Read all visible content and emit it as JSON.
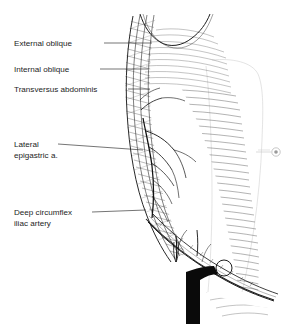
{
  "figure": {
    "background_color": "#ffffff",
    "ink_color": "#1d1d1d",
    "ghost_color": "#cfcfcf",
    "width": 294,
    "height": 324
  },
  "labels": [
    {
      "id": "external-oblique",
      "text": "External oblique",
      "x": 14,
      "y": 46,
      "leader_from_x": 104,
      "leader_from_y": 43,
      "leader_to_x": 152,
      "leader_to_y": 43
    },
    {
      "id": "internal-oblique",
      "text": "Internal oblique",
      "x": 14,
      "y": 72,
      "leader_from_x": 100,
      "leader_from_y": 69,
      "leader_to_x": 148,
      "leader_to_y": 69
    },
    {
      "id": "transversus-abdominis",
      "text": "Transversus abdominis",
      "x": 14,
      "y": 92,
      "leader_from_x": 128,
      "leader_from_y": 89,
      "leader_to_x": 150,
      "leader_to_y": 89
    },
    {
      "id": "lateral-epigastric",
      "text_line1": "Lateral",
      "text_line2": "epigastric a.",
      "x": 14,
      "y": 147,
      "leader_from_x": 58,
      "leader_from_y": 144,
      "leader_to_x": 143,
      "leader_to_y": 150
    },
    {
      "id": "deep-circumflex-iliac",
      "text_line1": "Deep circumflex",
      "text_line2": "iliac artery",
      "x": 14,
      "y": 215,
      "leader_from_x": 92,
      "leader_from_y": 212,
      "leader_to_x": 146,
      "leader_to_y": 210
    }
  ],
  "structures": [
    {
      "id": "costal-margin",
      "name": "costal margin curve"
    },
    {
      "id": "muscle-layer-bands",
      "name": "three oblique muscle layer bands with cross-hatching"
    },
    {
      "id": "rectus-abdominis",
      "name": "rectus abdominis belly with horizontal striations"
    },
    {
      "id": "aponeurosis-fibers",
      "name": "radiating aponeurotic fiber hatching"
    },
    {
      "id": "epigastric-vessel-tree",
      "name": "branching epigastric arterial tree"
    },
    {
      "id": "inguinal-ligament",
      "name": "inguinal ligament band"
    },
    {
      "id": "femoral-vessel",
      "name": "solid black femoral vessel trunk with branch"
    },
    {
      "id": "femoral-ring",
      "name": "open circle femoral ring"
    },
    {
      "id": "umbilicus-marker",
      "name": "faint circular umbilicus marker at right margin"
    },
    {
      "id": "ghost-torso",
      "name": "faint ghosted torso contour on right"
    }
  ]
}
